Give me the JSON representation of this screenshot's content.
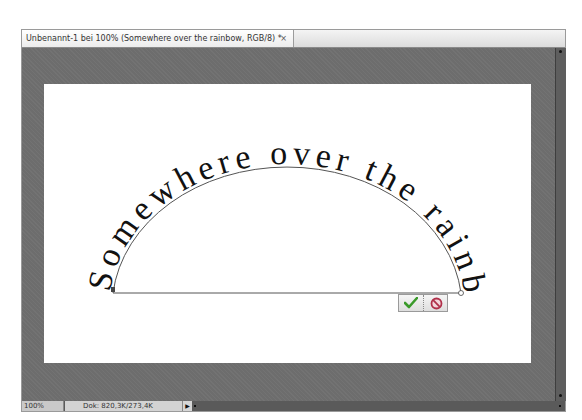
{
  "document_tab": {
    "title": "Unbenannt-1 bei 100% (Somewhere over the rainbow, RGB/8) *",
    "close_glyph": "×"
  },
  "canvas": {
    "path_text": "Somewhere over the rainbow",
    "text_color": "#111111",
    "path_color": "#555555"
  },
  "transform_commit": {
    "commit_icon": "checkmark-icon",
    "cancel_icon": "cancel-icon",
    "commit_color": "#3a9a2a",
    "cancel_color": "#b0304a"
  },
  "status_bar": {
    "zoom": "100%",
    "doc_info": "Dok: 820,3K/273,4K",
    "arrow_glyph": "▶"
  }
}
